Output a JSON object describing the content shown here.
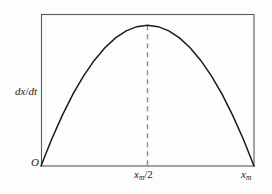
{
  "figure": {
    "background_color": "#fdfdfd",
    "frame_color": "#5a5a5a",
    "curve_color": "#1a1a1a",
    "dashed_color": "#8c8c8c"
  },
  "labels": {
    "y_axis": "dx/dt",
    "y_axis_numerator_var": "x",
    "y_axis_denominator_var": "t",
    "origin": "O",
    "tick_mid": "x",
    "tick_mid_sub": "m",
    "tick_mid_suffix": "/2",
    "tick_max": "x",
    "tick_max_sub": "m"
  },
  "chart_data": {
    "type": "line",
    "title": "",
    "xlabel": "x",
    "ylabel": "dx/dt",
    "grid": false,
    "legend": null,
    "xlim": [
      0,
      1
    ],
    "ylim": [
      0,
      0.27
    ],
    "xticks": [
      0,
      0.5,
      1
    ],
    "xticklabels": [
      "O",
      "x_m/2",
      "x_m"
    ],
    "yticks": [],
    "yticklabels": [],
    "annotations": [
      {
        "type": "dashed-vline",
        "x": 0.5,
        "y_from": 0,
        "y_to": 0.25,
        "color": "#8c8c8c"
      }
    ],
    "series": [
      {
        "name": "dx/dt = r x (1 - x/x_m)",
        "x": [
          0.0,
          0.05,
          0.1,
          0.15,
          0.2,
          0.25,
          0.3,
          0.35,
          0.4,
          0.45,
          0.5,
          0.55,
          0.6,
          0.65,
          0.7,
          0.75,
          0.8,
          0.85,
          0.9,
          0.95,
          1.0
        ],
        "values": [
          0.0,
          0.0475,
          0.09,
          0.1275,
          0.16,
          0.1875,
          0.21,
          0.2275,
          0.24,
          0.2475,
          0.25,
          0.2475,
          0.24,
          0.2275,
          0.21,
          0.1875,
          0.16,
          0.1275,
          0.09,
          0.0475,
          0.0
        ]
      }
    ]
  }
}
